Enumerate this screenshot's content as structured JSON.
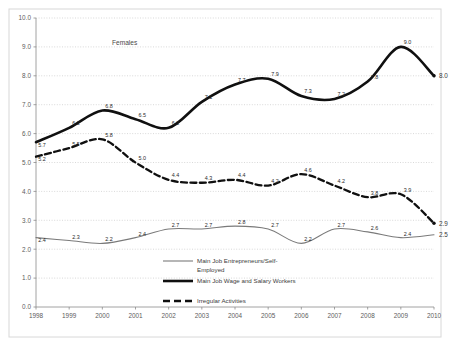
{
  "chart_data": {
    "type": "line",
    "title": "",
    "annotation": "Females",
    "xlabel": "",
    "ylabel": "",
    "x": [
      1998,
      1999,
      2000,
      2001,
      2002,
      2003,
      2004,
      2005,
      2006,
      2007,
      2008,
      2009,
      2010
    ],
    "categories": [
      "1998",
      "1999",
      "2000",
      "2001",
      "2002",
      "2003",
      "2004",
      "2005",
      "2006",
      "2007",
      "2008",
      "2009",
      "2010"
    ],
    "xlim": [
      1998,
      2010
    ],
    "ylim": [
      0.0,
      10.0
    ],
    "yticks": [
      "0.0",
      "1.0",
      "2.0",
      "3.0",
      "4.0",
      "5.0",
      "6.0",
      "7.0",
      "8.0",
      "9.0",
      "10.0"
    ],
    "grid": true,
    "legend_position": "bottom-center",
    "series": [
      {
        "name": "Main Job Entrepreneurs/Self-Employed",
        "style": "thin-solid",
        "color": "#7a7a7a",
        "values": [
          2.4,
          2.3,
          2.2,
          2.4,
          2.7,
          2.7,
          2.8,
          2.7,
          2.2,
          2.7,
          2.6,
          2.4,
          2.5
        ],
        "labels": [
          "2.4",
          "2.3",
          "2.2",
          "2.4",
          "2.7",
          "2.7",
          "2.8",
          "2.7",
          "2.2",
          "2.7",
          "2.6",
          "2.4",
          "2.5"
        ]
      },
      {
        "name": "Main Job Wage and Salary Workers",
        "style": "thick-solid",
        "color": "#101010",
        "values": [
          5.7,
          6.2,
          6.8,
          6.5,
          6.2,
          7.1,
          7.7,
          7.9,
          7.3,
          7.2,
          7.8,
          9.0,
          8.0
        ],
        "labels": [
          "5.7",
          "6.2",
          "6.8",
          "6.5",
          "6.2",
          "7.1",
          "7.7",
          "7.9",
          "7.3",
          "7.2",
          "7.8",
          "9.0",
          "8.0"
        ]
      },
      {
        "name": "Irregular Activities",
        "style": "dashed",
        "color": "#101010",
        "values": [
          5.2,
          5.5,
          5.8,
          5.0,
          4.4,
          4.3,
          4.4,
          4.2,
          4.6,
          4.2,
          3.8,
          3.9,
          2.9
        ],
        "labels": [
          "5.2",
          "5.5",
          "5.8",
          "5.0",
          "4.4",
          "4.3",
          "4.4",
          "4.2",
          "4.6",
          "4.2",
          "3.8",
          "3.9",
          "2.9"
        ]
      }
    ],
    "end_labels": [
      {
        "series": "Main Job Wage and Salary Workers",
        "text": "8.0",
        "value": 8.0
      },
      {
        "series": "Irregular Activities",
        "text": "2.9",
        "value": 2.9
      },
      {
        "series": "Main Job Entrepreneurs/Self-Employed",
        "text": "2.5",
        "value": 2.5
      }
    ]
  },
  "legend": {
    "items": [
      {
        "label": "Main Job Entrepreneurs/Self-Employed",
        "style": "thin-solid"
      },
      {
        "label": "Main Job Wage and Salary Workers",
        "style": "thick-solid"
      },
      {
        "label": "Irregular Activities",
        "style": "dashed"
      }
    ]
  },
  "header": {
    "caption": ""
  }
}
